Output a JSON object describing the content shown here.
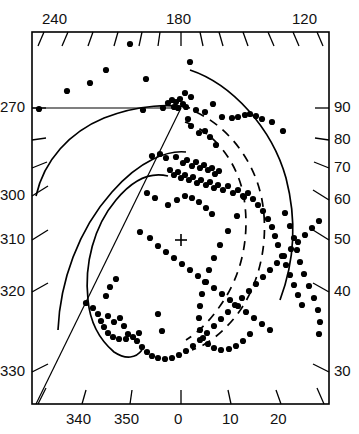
{
  "figure": {
    "title": "",
    "center_marker": "+",
    "frame": {
      "x0": 32,
      "y0": 32,
      "x1": 329,
      "y1": 404
    }
  },
  "chart_data": {
    "type": "scatter",
    "title": "",
    "xlabel": "",
    "ylabel": "",
    "grid": false,
    "legend": "none",
    "axes": {
      "top": {
        "labels": [
          "240",
          "180",
          "120"
        ],
        "label_x": [
          58,
          182,
          308
        ],
        "tick_count": 13,
        "tick_style": "slanted"
      },
      "left": {
        "labels": [
          "270",
          "300",
          "310",
          "320",
          "330"
        ],
        "label_y": [
          108,
          196,
          240,
          292,
          372
        ],
        "unlabeled_tick_y": [
          140,
          168
        ],
        "tick_style": "slanted"
      },
      "right": {
        "labels": [
          "90",
          "80",
          "70",
          "60",
          "50",
          "40",
          "30"
        ],
        "label_y": [
          108,
          140,
          168,
          200,
          240,
          292,
          372
        ],
        "tick_style": "slanted"
      },
      "bottom": {
        "labels": [
          "340",
          "350",
          "0",
          "10",
          "20"
        ],
        "label_x": [
          82,
          128,
          181,
          230,
          280
        ],
        "tick_style": "slanted"
      }
    },
    "points": [
      [
        130,
        44
      ],
      [
        106,
        70
      ],
      [
        146,
        79
      ],
      [
        190,
        62
      ],
      [
        185,
        93
      ],
      [
        90,
        83
      ],
      [
        67,
        91
      ],
      [
        39,
        109
      ],
      [
        143,
        110
      ],
      [
        163,
        108
      ],
      [
        168,
        103
      ],
      [
        172,
        100
      ],
      [
        176,
        102
      ],
      [
        180,
        99
      ],
      [
        183,
        104
      ],
      [
        174,
        107
      ],
      [
        178,
        108
      ],
      [
        186,
        107
      ],
      [
        191,
        97
      ],
      [
        196,
        110
      ],
      [
        205,
        112
      ],
      [
        213,
        104
      ],
      [
        222,
        117
      ],
      [
        232,
        118
      ],
      [
        238,
        117
      ],
      [
        245,
        115
      ],
      [
        250,
        114
      ],
      [
        256,
        116
      ],
      [
        262,
        119
      ],
      [
        272,
        122
      ],
      [
        283,
        131
      ],
      [
        188,
        119
      ],
      [
        191,
        126
      ],
      [
        199,
        133
      ],
      [
        205,
        131
      ],
      [
        210,
        137
      ],
      [
        216,
        145
      ],
      [
        152,
        156
      ],
      [
        160,
        154
      ],
      [
        166,
        158
      ],
      [
        176,
        157
      ],
      [
        183,
        163
      ],
      [
        187,
        160
      ],
      [
        192,
        166
      ],
      [
        196,
        162
      ],
      [
        200,
        168
      ],
      [
        204,
        165
      ],
      [
        208,
        170
      ],
      [
        212,
        168
      ],
      [
        215,
        174
      ],
      [
        219,
        171
      ],
      [
        170,
        170
      ],
      [
        174,
        175
      ],
      [
        178,
        172
      ],
      [
        181,
        178
      ],
      [
        185,
        175
      ],
      [
        189,
        180
      ],
      [
        193,
        177
      ],
      [
        197,
        183
      ],
      [
        201,
        180
      ],
      [
        206,
        185
      ],
      [
        210,
        182
      ],
      [
        214,
        188
      ],
      [
        218,
        185
      ],
      [
        223,
        190
      ],
      [
        228,
        186
      ],
      [
        233,
        193
      ],
      [
        238,
        190
      ],
      [
        243,
        196
      ],
      [
        248,
        193
      ],
      [
        253,
        199
      ],
      [
        258,
        205
      ],
      [
        263,
        211
      ],
      [
        268,
        219
      ],
      [
        272,
        227
      ],
      [
        275,
        236
      ],
      [
        278,
        245
      ],
      [
        282,
        256
      ],
      [
        286,
        265
      ],
      [
        290,
        275
      ],
      [
        294,
        285
      ],
      [
        298,
        295
      ],
      [
        302,
        305
      ],
      [
        147,
        193
      ],
      [
        155,
        198
      ],
      [
        168,
        205
      ],
      [
        177,
        200
      ],
      [
        185,
        196
      ],
      [
        192,
        198
      ],
      [
        199,
        202
      ],
      [
        206,
        208
      ],
      [
        212,
        214
      ],
      [
        140,
        232
      ],
      [
        150,
        238
      ],
      [
        158,
        246
      ],
      [
        166,
        252
      ],
      [
        174,
        258
      ],
      [
        182,
        264
      ],
      [
        190,
        270
      ],
      [
        198,
        276
      ],
      [
        206,
        282
      ],
      [
        214,
        288
      ],
      [
        222,
        294
      ],
      [
        230,
        300
      ],
      [
        238,
        306
      ],
      [
        246,
        312
      ],
      [
        254,
        318
      ],
      [
        262,
        324
      ],
      [
        270,
        330
      ],
      [
        244,
        197
      ],
      [
        237,
        216
      ],
      [
        228,
        231
      ],
      [
        220,
        245
      ],
      [
        214,
        258
      ],
      [
        209,
        270
      ],
      [
        205,
        282
      ],
      [
        202,
        294
      ],
      [
        200,
        306
      ],
      [
        199,
        318
      ],
      [
        200,
        330
      ],
      [
        203,
        338
      ],
      [
        208,
        344
      ],
      [
        214,
        348
      ],
      [
        221,
        350
      ],
      [
        229,
        349
      ],
      [
        236,
        346
      ],
      [
        243,
        341
      ],
      [
        250,
        334
      ],
      [
        86,
        303
      ],
      [
        93,
        308
      ],
      [
        98,
        314
      ],
      [
        101,
        321
      ],
      [
        104,
        327
      ],
      [
        108,
        333
      ],
      [
        113,
        337
      ],
      [
        119,
        339
      ],
      [
        126,
        339
      ],
      [
        133,
        337
      ],
      [
        139,
        333
      ],
      [
        116,
        279
      ],
      [
        110,
        287
      ],
      [
        106,
        296
      ],
      [
        108,
        316
      ],
      [
        114,
        322
      ],
      [
        120,
        318
      ],
      [
        124,
        326
      ],
      [
        128,
        334
      ],
      [
        158,
        314
      ],
      [
        162,
        331
      ],
      [
        137,
        341
      ],
      [
        142,
        347
      ],
      [
        147,
        352
      ],
      [
        152,
        356
      ],
      [
        158,
        358
      ],
      [
        165,
        359
      ],
      [
        172,
        358
      ],
      [
        179,
        355
      ],
      [
        186,
        351
      ],
      [
        193,
        346
      ],
      [
        200,
        340
      ],
      [
        207,
        333
      ],
      [
        214,
        326
      ],
      [
        221,
        319
      ],
      [
        228,
        312
      ],
      [
        235,
        305
      ],
      [
        242,
        298
      ],
      [
        249,
        291
      ],
      [
        256,
        284
      ],
      [
        263,
        277
      ],
      [
        270,
        270
      ],
      [
        277,
        263
      ],
      [
        284,
        256
      ],
      [
        291,
        249
      ],
      [
        298,
        242
      ],
      [
        305,
        235
      ],
      [
        312,
        228
      ],
      [
        319,
        221
      ],
      [
        285,
        213
      ],
      [
        290,
        226
      ],
      [
        294,
        238
      ],
      [
        297,
        250
      ],
      [
        300,
        262
      ],
      [
        304,
        274
      ],
      [
        309,
        286
      ],
      [
        314,
        298
      ],
      [
        318,
        310
      ],
      [
        320,
        322
      ],
      [
        319,
        334
      ]
    ],
    "curves": [
      {
        "name": "outer-solid-arc-right",
        "style": "solid"
      },
      {
        "name": "inner-dashed-arc-a",
        "style": "dashed"
      },
      {
        "name": "inner-dashed-arc-b",
        "style": "dashed"
      },
      {
        "name": "outer-solid-arc-left",
        "style": "solid"
      },
      {
        "name": "mid-solid-arc-left",
        "style": "solid"
      },
      {
        "name": "inner-solid-arc-left",
        "style": "solid"
      },
      {
        "name": "horizontal-reference-line",
        "style": "solid"
      },
      {
        "name": "diagonal-reference-line",
        "style": "solid"
      }
    ]
  }
}
